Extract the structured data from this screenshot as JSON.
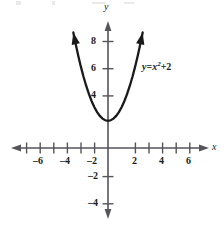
{
  "chart_data": {
    "type": "line",
    "title": "",
    "subtitle": "",
    "xlabel": "x",
    "ylabel": "y",
    "equation": "y = x² + 2",
    "equation_parts": {
      "lhs": "y",
      "equals": "=",
      "base": "x",
      "exponent": "2",
      "plus": "+",
      "constant": "2"
    },
    "function": "y = x^2 + 2",
    "vertex": [
      0,
      2
    ],
    "xlim": [
      -7.4,
      7.4
    ],
    "ylim": [
      -5.4,
      9.4
    ],
    "x_ticks": [
      -7,
      -6,
      -5,
      -4,
      -3,
      -2,
      -1,
      1,
      2,
      3,
      4,
      5,
      6,
      7
    ],
    "y_ticks": [
      -4,
      -3,
      -2,
      -1,
      1,
      2,
      3,
      4,
      5,
      6,
      7,
      8
    ],
    "x_tick_labels": [
      {
        "value": -6,
        "text": "–6"
      },
      {
        "value": -4,
        "text": "–4"
      },
      {
        "value": -2,
        "text": "–2"
      },
      {
        "value": 2,
        "text": "2"
      },
      {
        "value": 4,
        "text": "4"
      },
      {
        "value": 6,
        "text": "6"
      }
    ],
    "y_tick_labels": [
      {
        "value": 8,
        "text": "8"
      },
      {
        "value": 6,
        "text": "6"
      },
      {
        "value": 4,
        "text": "4"
      },
      {
        "value": -2,
        "text": "–2"
      },
      {
        "value": -4,
        "text": "–4"
      }
    ],
    "grid": false,
    "legend": "none",
    "series": [
      {
        "name": "y = x² + 2",
        "color": "#1a1a1a",
        "x_domain": [
          -2.55,
          2.55
        ],
        "points": [
          [
            -2.55,
            8.5
          ],
          [
            -2.4,
            7.76
          ],
          [
            -2.2,
            6.84
          ],
          [
            -2.0,
            6.0
          ],
          [
            -1.8,
            5.24
          ],
          [
            -1.6,
            4.56
          ],
          [
            -1.4,
            3.96
          ],
          [
            -1.2,
            3.44
          ],
          [
            -1.0,
            3.0
          ],
          [
            -0.8,
            2.64
          ],
          [
            -0.6,
            2.36
          ],
          [
            -0.4,
            2.16
          ],
          [
            -0.2,
            2.04
          ],
          [
            0.0,
            2.0
          ],
          [
            0.2,
            2.04
          ],
          [
            0.4,
            2.16
          ],
          [
            0.6,
            2.36
          ],
          [
            0.8,
            2.64
          ],
          [
            1.0,
            3.0
          ],
          [
            1.2,
            3.44
          ],
          [
            1.4,
            3.96
          ],
          [
            1.6,
            4.56
          ],
          [
            1.8,
            5.24
          ],
          [
            2.0,
            6.0
          ],
          [
            2.2,
            6.84
          ],
          [
            2.4,
            7.76
          ],
          [
            2.55,
            8.5
          ]
        ],
        "arrow_ends": [
          "start",
          "end"
        ]
      }
    ],
    "colors": {
      "axis": "#55555a",
      "curve": "#1a1a1a",
      "text": "#1a1a1a",
      "background": "#ffffff"
    }
  }
}
